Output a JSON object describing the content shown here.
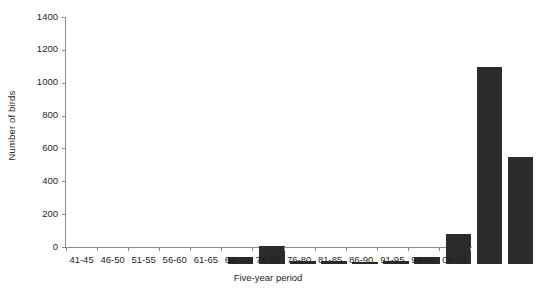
{
  "chart_data": {
    "type": "bar",
    "title": "",
    "xlabel": "Five-year period",
    "ylabel": "Number of birds",
    "categories": [
      "41-45",
      "46-50",
      "51-55",
      "56-60",
      "61-65",
      "66-70",
      "71-75",
      "76-80",
      "81-85",
      "86-90",
      "91-95",
      "96-00",
      "01-05"
    ],
    "values": [
      0,
      0,
      0,
      40,
      110,
      18,
      18,
      15,
      18,
      40,
      180,
      1200,
      650
    ],
    "ylim": [
      0,
      1400
    ],
    "yticks": [
      0,
      200,
      400,
      600,
      800,
      1000,
      1200,
      1400
    ],
    "ytick_labels": [
      "0",
      "200",
      "400",
      "600",
      "800",
      "1000",
      "1200",
      "1400"
    ],
    "grid": false,
    "legend": "none",
    "bar_color": "#2b2b2b",
    "axis_color": "#8a8a8a",
    "background_color": "#ffffff"
  }
}
